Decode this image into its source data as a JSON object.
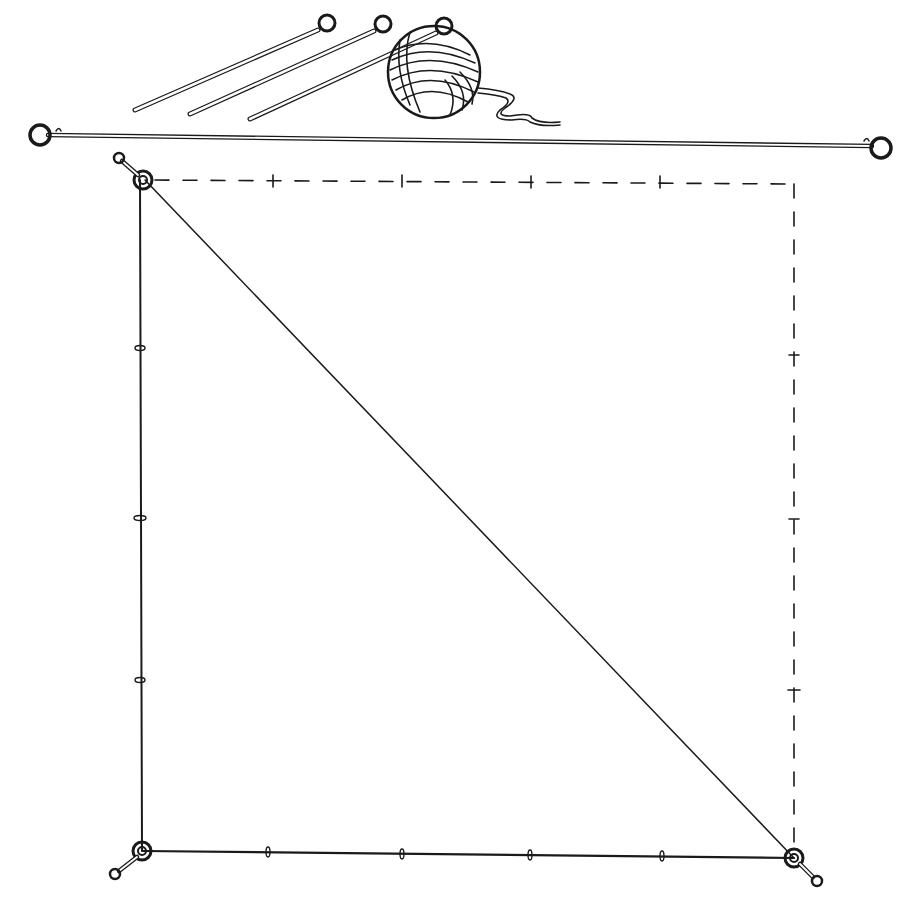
{
  "figure": {
    "type": "line-illustration",
    "colors": {
      "ink": "#1a1a1a",
      "background": "#ffffff"
    },
    "top_items": {
      "stakes": [
        {
          "head": [
            327,
            24
          ],
          "tip": [
            135,
            110
          ]
        },
        {
          "head": [
            384,
            25
          ],
          "tip": [
            188,
            114
          ]
        },
        {
          "head": [
            445,
            27
          ],
          "tip": [
            249,
            119
          ]
        }
      ],
      "yarn_ball": {
        "center": [
          434,
          72
        ],
        "radius": 46
      }
    },
    "measuring_cord": {
      "left_ring": [
        40,
        135
      ],
      "right_ring": [
        881,
        148
      ]
    },
    "triangle": {
      "top_left": [
        143,
        180
      ],
      "bottom_left": [
        143,
        851
      ],
      "bottom_right": [
        794,
        858
      ],
      "left_knots_y": [
        348,
        518,
        680
      ],
      "bottom_knots_x": [
        268,
        402,
        530,
        662
      ]
    },
    "dashed_square": {
      "top_y": 180,
      "right_x": 794,
      "top_ticks_x": [
        273,
        402,
        531,
        660
      ],
      "right_ticks_y": [
        355,
        519,
        690
      ]
    }
  }
}
